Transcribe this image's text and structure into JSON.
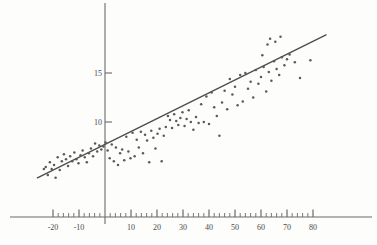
{
  "figure": {
    "name": "hand-drawn-scatter-plot-with-regression-line",
    "background_color": "#fdfdfc",
    "ink_color": "#555555",
    "point_color": "#5a5a5a",
    "axis_color": "#6a6a6a",
    "label_color": "#4a4a4a"
  },
  "chart_data": {
    "type": "scatter",
    "title": "",
    "subtitle": "",
    "xlabel": "",
    "ylabel": "",
    "grid": false,
    "legend": null,
    "xlim": [
      -28,
      88
    ],
    "ylim": [
      3.0,
      19.2
    ],
    "x_ticks_major": [
      -20,
      -10,
      0,
      10,
      20,
      30,
      40,
      50,
      60,
      70,
      80
    ],
    "x_tick_labels": [
      "-20",
      "-10",
      "",
      "10",
      "20",
      "30",
      "40",
      "50",
      "60",
      "70",
      "80"
    ],
    "x_ticks_minor_step": 2,
    "y_ticks_major": [
      10,
      15
    ],
    "y_tick_labels": [
      "10",
      "15"
    ],
    "regression_line": {
      "x_start": -26,
      "y_start": 4.3,
      "x_end": 85,
      "y_end": 18.9,
      "slope": 0.1315,
      "intercept": 7.72
    },
    "axes": {
      "x_axis_y_value": 3.55,
      "y_axis_x_value": 0
    },
    "n_points": 118,
    "points": [
      [
        -23.5,
        5.2
      ],
      [
        -22.8,
        5.4
      ],
      [
        -22.0,
        4.6
      ],
      [
        -21.2,
        5.9
      ],
      [
        -20.5,
        5.2
      ],
      [
        -19.6,
        5.6
      ],
      [
        -19.0,
        4.3
      ],
      [
        -18.2,
        6.4
      ],
      [
        -17.4,
        5.1
      ],
      [
        -16.6,
        6.0
      ],
      [
        -15.8,
        6.7
      ],
      [
        -15.0,
        6.2
      ],
      [
        -14.2,
        5.5
      ],
      [
        -13.4,
        6.5
      ],
      [
        -12.6,
        6.0
      ],
      [
        -11.8,
        6.9
      ],
      [
        -11.0,
        6.2
      ],
      [
        -10.2,
        5.8
      ],
      [
        -9.4,
        6.6
      ],
      [
        -8.6,
        7.1
      ],
      [
        -7.8,
        6.4
      ],
      [
        -7.0,
        5.9
      ],
      [
        -6.2,
        6.8
      ],
      [
        -5.4,
        7.3
      ],
      [
        -4.6,
        6.5
      ],
      [
        -3.8,
        7.8
      ],
      [
        -3.0,
        7.0
      ],
      [
        -2.2,
        7.6
      ],
      [
        -1.4,
        7.2
      ],
      [
        -0.6,
        7.5
      ],
      [
        0.2,
        7.9
      ],
      [
        1.0,
        7.1
      ],
      [
        1.8,
        6.3
      ],
      [
        2.6,
        7.7
      ],
      [
        3.4,
        6.0
      ],
      [
        4.2,
        7.4
      ],
      [
        5.0,
        5.6
      ],
      [
        5.8,
        6.8
      ],
      [
        6.6,
        7.2
      ],
      [
        7.4,
        6.1
      ],
      [
        8.2,
        8.5
      ],
      [
        9.0,
        7.0
      ],
      [
        9.8,
        6.3
      ],
      [
        10.6,
        8.9
      ],
      [
        11.4,
        6.5
      ],
      [
        12.2,
        8.2
      ],
      [
        13.0,
        7.4
      ],
      [
        13.8,
        9.0
      ],
      [
        14.6,
        6.8
      ],
      [
        15.4,
        8.7
      ],
      [
        16.2,
        8.1
      ],
      [
        17.0,
        5.9
      ],
      [
        17.8,
        9.1
      ],
      [
        18.6,
        8.4
      ],
      [
        19.4,
        7.3
      ],
      [
        20.2,
        8.8
      ],
      [
        21.0,
        9.3
      ],
      [
        21.8,
        6.0
      ],
      [
        22.6,
        8.6
      ],
      [
        23.4,
        9.5
      ],
      [
        24.2,
        10.6
      ],
      [
        25.0,
        10.2
      ],
      [
        25.8,
        9.4
      ],
      [
        26.6,
        10.8
      ],
      [
        27.4,
        10.1
      ],
      [
        28.2,
        9.7
      ],
      [
        29.0,
        10.4
      ],
      [
        29.8,
        11.0
      ],
      [
        30.6,
        9.6
      ],
      [
        31.4,
        10.3
      ],
      [
        32.2,
        11.2
      ],
      [
        33.0,
        10.0
      ],
      [
        34.0,
        9.2
      ],
      [
        35.0,
        10.5
      ],
      [
        36.0,
        9.9
      ],
      [
        37.0,
        11.8
      ],
      [
        38.0,
        10.0
      ],
      [
        39.0,
        12.6
      ],
      [
        40.0,
        9.8
      ],
      [
        41.0,
        13.0
      ],
      [
        42.0,
        11.5
      ],
      [
        43.0,
        10.6
      ],
      [
        44.0,
        8.6
      ],
      [
        45.0,
        12.0
      ],
      [
        46.0,
        13.2
      ],
      [
        47.0,
        11.3
      ],
      [
        48.0,
        14.4
      ],
      [
        49.0,
        12.8
      ],
      [
        50.0,
        13.6
      ],
      [
        51.0,
        11.7
      ],
      [
        52.0,
        14.8
      ],
      [
        53.0,
        12.1
      ],
      [
        54.0,
        15.0
      ],
      [
        55.0,
        13.4
      ],
      [
        56.0,
        14.1
      ],
      [
        57.0,
        12.5
      ],
      [
        58.0,
        15.3
      ],
      [
        59.0,
        13.9
      ],
      [
        60.0,
        14.6
      ],
      [
        60.5,
        16.8
      ],
      [
        61.0,
        15.6
      ],
      [
        62.0,
        13.1
      ],
      [
        62.5,
        17.9
      ],
      [
        63.0,
        15.1
      ],
      [
        63.5,
        18.5
      ],
      [
        64.0,
        14.2
      ],
      [
        65.0,
        16.2
      ],
      [
        65.5,
        18.2
      ],
      [
        66.0,
        15.4
      ],
      [
        67.0,
        14.8
      ],
      [
        67.5,
        18.7
      ],
      [
        68.0,
        16.6
      ],
      [
        69.0,
        15.8
      ],
      [
        70.0,
        16.4
      ],
      [
        71.0,
        16.9
      ],
      [
        73.0,
        16.1
      ],
      [
        75.0,
        14.5
      ],
      [
        79.0,
        16.3
      ]
    ]
  }
}
